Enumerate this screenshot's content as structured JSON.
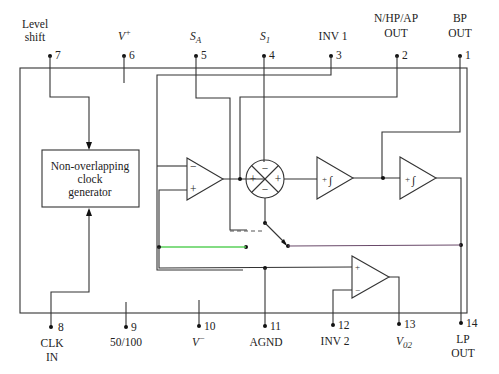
{
  "pins_top": [
    {
      "num": "7",
      "label_lines": [
        "Level",
        "shift"
      ]
    },
    {
      "num": "6",
      "label": "V",
      "sup": "+"
    },
    {
      "num": "5",
      "label": "S",
      "sub": "A"
    },
    {
      "num": "4",
      "label": "S",
      "sub": "1"
    },
    {
      "num": "3",
      "label": "INV 1"
    },
    {
      "num": "2",
      "label_lines": [
        "N/HP/AP",
        "OUT"
      ]
    },
    {
      "num": "1",
      "label_lines": [
        "BP",
        "OUT"
      ]
    }
  ],
  "pins_bottom": [
    {
      "num": "8",
      "label_lines": [
        "CLK",
        "IN"
      ]
    },
    {
      "num": "9",
      "label": "50/100"
    },
    {
      "num": "10",
      "label": "V",
      "sup": "−"
    },
    {
      "num": "11",
      "label": "AGND"
    },
    {
      "num": "12",
      "label": "INV 2"
    },
    {
      "num": "13",
      "label": "V",
      "sub": "02"
    },
    {
      "num": "14",
      "label_lines": [
        "LP",
        "OUT"
      ]
    }
  ],
  "blocks": {
    "clock": {
      "lines": [
        "Non-overlapping",
        "clock",
        "generator"
      ]
    },
    "opamp1": {
      "minus": "−",
      "plus": "+"
    },
    "summer": {
      "top": "−",
      "left": "+",
      "right": "+",
      "bottom": "−"
    },
    "integrator1": {
      "sign": "+",
      "symbol": "∫"
    },
    "integrator2": {
      "sign": "+",
      "symbol": "∫"
    },
    "opamp2": {
      "plus": "+",
      "minus": "−"
    }
  },
  "colors": {
    "wire": "#333333",
    "green_wire": "#5ad05a",
    "magenta_wire": "#b060b0"
  }
}
